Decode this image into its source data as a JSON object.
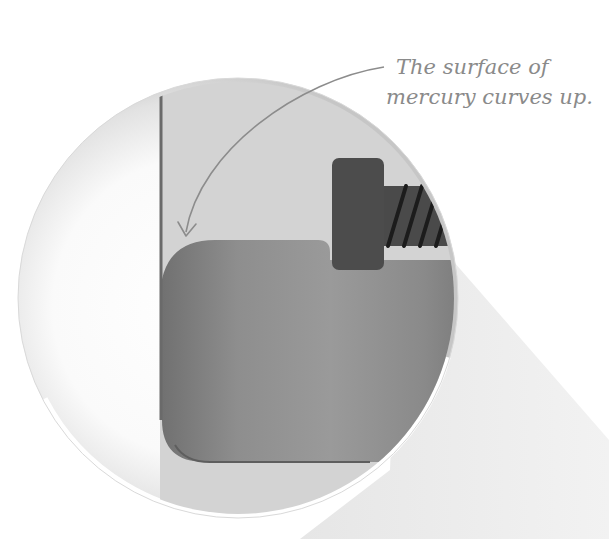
{
  "annotation": {
    "line1": "The surface of",
    "line2": "mercury curves up."
  },
  "colors": {
    "background": "#ffffff",
    "lens_rim_light": "#fdfdfd",
    "lens_rim_shadow": "#c9c9c9",
    "tube_interior": "#d4d4d4",
    "tube_wall": "#6e6e6e",
    "mercury_light": "#8f8f8f",
    "mercury_dark": "#6a6a6a",
    "electrode": "#4a4a4a",
    "electrode_thread": "#1e1e1e",
    "beam": "#ececec",
    "annotation_text": "#8a8a8a",
    "arrow": "#8c8c8c"
  },
  "elements": {
    "magnifier_lens": "magnified view",
    "glass_tube": "tube wall",
    "mercury": "mercury column",
    "electrode": "screw electrode",
    "projection_beam": "magnification cone"
  }
}
